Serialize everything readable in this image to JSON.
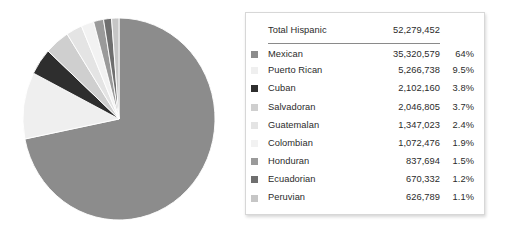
{
  "chart_data": {
    "type": "pie",
    "title": "",
    "legend_position": "right",
    "total_label": "Total Hispanic",
    "total_value": "52,279,452",
    "total_value_number": 52279452,
    "start_angle_deg": 0,
    "direction": "clockwise",
    "categories": [
      "Mexican",
      "Puerto Rican",
      "Cuban",
      "Salvadoran",
      "Guatemalan",
      "Colombian",
      "Honduran",
      "Ecuadorian",
      "Peruvian"
    ],
    "values": [
      35320579,
      5266738,
      2102160,
      2046805,
      1347023,
      1072476,
      837694,
      670332,
      626789
    ],
    "percents": [
      64,
      9.5,
      3.8,
      3.7,
      2.4,
      1.9,
      1.5,
      1.2,
      1.1
    ],
    "colors": [
      "#8c8c8c",
      "#efefef",
      "#2e2e2e",
      "#cfcfcf",
      "#e4e4e4",
      "#f2f2f2",
      "#9a9a9a",
      "#6f6f6f",
      "#c6c6c6"
    ],
    "rows": [
      {
        "label": "Mexican",
        "value": "35,320,579",
        "percent": "64%",
        "color": "#8c8c8c"
      },
      {
        "label": "Puerto Rican",
        "value": "5,266,738",
        "percent": "9.5%",
        "color": "#efefef"
      },
      {
        "label": "Cuban",
        "value": "2,102,160",
        "percent": "3.8%",
        "color": "#2e2e2e"
      },
      {
        "label": "Salvadoran",
        "value": "2,046,805",
        "percent": "3.7%",
        "color": "#cfcfcf"
      },
      {
        "label": "Guatemalan",
        "value": "1,347,023",
        "percent": "2.4%",
        "color": "#e4e4e4"
      },
      {
        "label": "Colombian",
        "value": "1,072,476",
        "percent": "1.9%",
        "color": "#f2f2f2"
      },
      {
        "label": "Honduran",
        "value": "837,694",
        "percent": "1.5%",
        "color": "#9a9a9a"
      },
      {
        "label": "Ecuadorian",
        "value": "670,332",
        "percent": "1.2%",
        "color": "#6f6f6f"
      },
      {
        "label": "Peruvian",
        "value": "626,789",
        "percent": "1.1%",
        "color": "#c6c6c6"
      }
    ]
  }
}
